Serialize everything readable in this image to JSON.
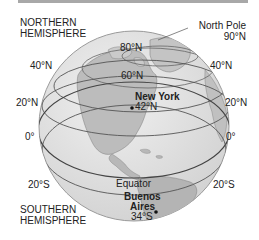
{
  "figure": {
    "title_hemispheres": {
      "northern": [
        "NORTHERN",
        "HEMISPHERE"
      ],
      "southern": [
        "SOUTHERN",
        "HEMISPHERE"
      ]
    },
    "north_pole": {
      "label": "North Pole",
      "lat": "90°N"
    },
    "latitude_labels_left": [
      "40°N",
      "20°N",
      "0°",
      "20°S"
    ],
    "latitude_labels_right": [
      "40°N",
      "20°N",
      "0°",
      "20°S"
    ],
    "inner_labels": {
      "lat80": "80°N",
      "lat60": "60°N"
    },
    "equator_label": "Equator",
    "cities": [
      {
        "name": "New York",
        "lat": "42°N"
      },
      {
        "name_line1": "Buenos",
        "name_line2": "Aires",
        "lat": "34°S"
      }
    ]
  },
  "colors": {
    "ocean": "#e3e3e3",
    "land": "#bdbdbd",
    "land_dark": "#a9a9a9",
    "lines": "#555555",
    "text": "#222222"
  }
}
